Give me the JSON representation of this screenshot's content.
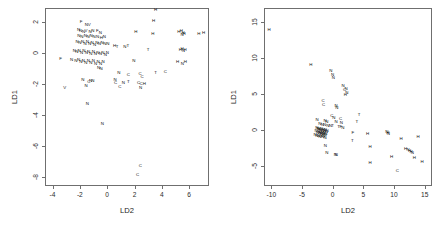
{
  "figure": {
    "type": "scatter-matrix",
    "panel_count": 2,
    "background": "#ffffff",
    "frame_color": "#6f6f6f",
    "text_color": "#111111"
  },
  "chart_data": [
    {
      "type": "scatter",
      "title": "",
      "subtitle": "",
      "xlabel": "LD2",
      "ylabel": "LD1",
      "xlim": [
        -4.55,
        7.45
      ],
      "ylim": [
        -8.6,
        2.9
      ],
      "xticks": [
        -4,
        -2,
        0,
        2,
        4,
        6
      ],
      "yticks": [
        2,
        0,
        -2,
        -4,
        -6,
        -8
      ],
      "xticklabels": [
        "-4",
        "-2",
        "0",
        "2",
        "4",
        "6"
      ],
      "yticklabels": [
        "2",
        "0",
        "-2",
        "-4",
        "-6",
        "-8"
      ],
      "grid": false,
      "legend": null,
      "marker_style": "text-glyph",
      "classes": [
        "H",
        "N",
        "C",
        "T",
        "V",
        "F"
      ],
      "points": [
        {
          "x": 3.55,
          "y": 2.78,
          "label": "H"
        },
        {
          "x": 3.4,
          "y": 2.05,
          "label": "H"
        },
        {
          "x": -1.9,
          "y": 2.02,
          "label": "F"
        },
        {
          "x": -1.52,
          "y": 1.8,
          "label": "N"
        },
        {
          "x": -1.32,
          "y": 1.78,
          "label": "V"
        },
        {
          "x": -2.1,
          "y": 1.48,
          "label": "N"
        },
        {
          "x": -1.95,
          "y": 1.4,
          "label": "N"
        },
        {
          "x": -1.72,
          "y": 1.38,
          "label": "N"
        },
        {
          "x": -1.55,
          "y": 1.42,
          "label": "V"
        },
        {
          "x": -1.25,
          "y": 1.36,
          "label": "N"
        },
        {
          "x": -1.05,
          "y": 1.42,
          "label": "N"
        },
        {
          "x": -0.72,
          "y": 1.4,
          "label": "F"
        },
        {
          "x": -0.5,
          "y": 1.28,
          "label": "N"
        },
        {
          "x": -2.08,
          "y": 1.1,
          "label": "N"
        },
        {
          "x": -1.86,
          "y": 1.05,
          "label": "N"
        },
        {
          "x": -1.6,
          "y": 1.12,
          "label": "N"
        },
        {
          "x": -1.4,
          "y": 1.0,
          "label": "N"
        },
        {
          "x": -1.18,
          "y": 1.08,
          "label": "N"
        },
        {
          "x": -0.95,
          "y": 1.0,
          "label": "N"
        },
        {
          "x": -0.7,
          "y": 1.05,
          "label": "N"
        },
        {
          "x": -0.42,
          "y": 0.98,
          "label": "H"
        },
        {
          "x": -0.2,
          "y": 1.05,
          "label": "N"
        },
        {
          "x": 2.1,
          "y": 1.32,
          "label": "H"
        },
        {
          "x": 3.35,
          "y": 1.25,
          "label": "H"
        },
        {
          "x": 5.25,
          "y": 1.35,
          "label": "H"
        },
        {
          "x": 5.42,
          "y": 1.4,
          "label": "H"
        },
        {
          "x": 5.55,
          "y": 1.3,
          "label": "H"
        },
        {
          "x": 5.62,
          "y": 1.22,
          "label": "H"
        },
        {
          "x": 5.48,
          "y": 1.18,
          "label": "N"
        },
        {
          "x": 6.7,
          "y": 1.2,
          "label": "H"
        },
        {
          "x": 7.05,
          "y": 1.28,
          "label": "H"
        },
        {
          "x": -2.2,
          "y": 0.7,
          "label": "N"
        },
        {
          "x": -2.0,
          "y": 0.62,
          "label": "N"
        },
        {
          "x": -1.8,
          "y": 0.72,
          "label": "N"
        },
        {
          "x": -1.62,
          "y": 0.58,
          "label": "N"
        },
        {
          "x": -1.45,
          "y": 0.68,
          "label": "N"
        },
        {
          "x": -1.28,
          "y": 0.55,
          "label": "N"
        },
        {
          "x": -1.1,
          "y": 0.66,
          "label": "N"
        },
        {
          "x": -0.92,
          "y": 0.52,
          "label": "N"
        },
        {
          "x": -0.75,
          "y": 0.62,
          "label": "N"
        },
        {
          "x": -0.58,
          "y": 0.58,
          "label": "N"
        },
        {
          "x": -0.38,
          "y": 0.64,
          "label": "N"
        },
        {
          "x": -0.18,
          "y": 0.55,
          "label": "N"
        },
        {
          "x": 0.05,
          "y": 0.6,
          "label": "N"
        },
        {
          "x": 0.55,
          "y": 0.42,
          "label": "H"
        },
        {
          "x": 0.72,
          "y": 0.38,
          "label": "T"
        },
        {
          "x": 1.3,
          "y": 0.35,
          "label": "N"
        },
        {
          "x": 1.52,
          "y": 0.45,
          "label": "T"
        },
        {
          "x": 3.0,
          "y": 0.18,
          "label": "T"
        },
        {
          "x": 5.35,
          "y": 0.18,
          "label": "H"
        },
        {
          "x": 5.48,
          "y": 0.22,
          "label": "H"
        },
        {
          "x": 5.58,
          "y": 0.12,
          "label": "N"
        },
        {
          "x": 5.7,
          "y": 0.2,
          "label": "H"
        },
        {
          "x": -2.4,
          "y": 0.1,
          "label": "N"
        },
        {
          "x": -2.22,
          "y": 0.05,
          "label": "N"
        },
        {
          "x": -2.05,
          "y": 0.12,
          "label": "N"
        },
        {
          "x": -1.88,
          "y": 0.0,
          "label": "N"
        },
        {
          "x": -1.7,
          "y": 0.1,
          "label": "N"
        },
        {
          "x": -1.52,
          "y": -0.02,
          "label": "N"
        },
        {
          "x": -1.36,
          "y": 0.08,
          "label": "N"
        },
        {
          "x": -1.2,
          "y": -0.05,
          "label": "N"
        },
        {
          "x": -1.02,
          "y": 0.05,
          "label": "N"
        },
        {
          "x": -0.86,
          "y": -0.08,
          "label": "N"
        },
        {
          "x": -0.68,
          "y": 0.02,
          "label": "N"
        },
        {
          "x": -0.5,
          "y": -0.1,
          "label": "N"
        },
        {
          "x": -0.32,
          "y": 0.0,
          "label": "N"
        },
        {
          "x": -0.14,
          "y": -0.12,
          "label": "N"
        },
        {
          "x": 0.02,
          "y": -0.02,
          "label": "N"
        },
        {
          "x": -3.4,
          "y": -0.42,
          "label": "F"
        },
        {
          "x": -2.6,
          "y": -0.48,
          "label": "N"
        },
        {
          "x": -2.3,
          "y": -0.55,
          "label": "N"
        },
        {
          "x": -2.1,
          "y": -0.45,
          "label": "N"
        },
        {
          "x": -1.92,
          "y": -0.6,
          "label": "N"
        },
        {
          "x": -1.74,
          "y": -0.5,
          "label": "N"
        },
        {
          "x": -1.56,
          "y": -0.65,
          "label": "N"
        },
        {
          "x": -1.38,
          "y": -0.52,
          "label": "N"
        },
        {
          "x": -1.2,
          "y": -0.68,
          "label": "N"
        },
        {
          "x": -1.02,
          "y": -0.55,
          "label": "N"
        },
        {
          "x": -0.84,
          "y": -0.7,
          "label": "N"
        },
        {
          "x": -0.66,
          "y": -0.58,
          "label": "N"
        },
        {
          "x": -0.48,
          "y": -0.72,
          "label": "N"
        },
        {
          "x": -0.3,
          "y": -0.6,
          "label": "N"
        },
        {
          "x": -0.62,
          "y": -0.95,
          "label": "N"
        },
        {
          "x": -0.45,
          "y": -1.02,
          "label": "N"
        },
        {
          "x": 1.95,
          "y": -0.55,
          "label": "N"
        },
        {
          "x": 5.15,
          "y": -0.62,
          "label": "H"
        },
        {
          "x": 5.5,
          "y": -0.7,
          "label": "N"
        },
        {
          "x": 5.72,
          "y": -0.62,
          "label": "H"
        },
        {
          "x": 3.55,
          "y": -1.28,
          "label": "T"
        },
        {
          "x": 4.25,
          "y": -1.25,
          "label": "C"
        },
        {
          "x": 0.85,
          "y": -1.28,
          "label": "N"
        },
        {
          "x": 1.55,
          "y": -1.4,
          "label": "C"
        },
        {
          "x": 2.4,
          "y": -1.38,
          "label": "C"
        },
        {
          "x": 2.55,
          "y": -1.55,
          "label": "C"
        },
        {
          "x": -1.78,
          "y": -1.78,
          "label": "N"
        },
        {
          "x": -1.35,
          "y": -1.85,
          "label": "C"
        },
        {
          "x": -1.22,
          "y": -1.8,
          "label": "N"
        },
        {
          "x": -1.05,
          "y": -1.82,
          "label": "N"
        },
        {
          "x": 0.58,
          "y": -1.72,
          "label": "N"
        },
        {
          "x": 0.62,
          "y": -1.95,
          "label": "C"
        },
        {
          "x": 1.18,
          "y": -1.92,
          "label": "N"
        },
        {
          "x": 1.55,
          "y": -1.9,
          "label": "T"
        },
        {
          "x": 2.3,
          "y": -1.92,
          "label": "C"
        },
        {
          "x": 2.48,
          "y": -2.0,
          "label": "C"
        },
        {
          "x": 2.72,
          "y": -1.98,
          "label": "H"
        },
        {
          "x": -3.1,
          "y": -2.3,
          "label": "V"
        },
        {
          "x": -1.55,
          "y": -2.15,
          "label": "N"
        },
        {
          "x": 0.92,
          "y": -2.22,
          "label": "C"
        },
        {
          "x": 2.45,
          "y": -2.3,
          "label": "N"
        },
        {
          "x": -1.45,
          "y": -3.3,
          "label": "N"
        },
        {
          "x": -0.35,
          "y": -4.58,
          "label": "N"
        },
        {
          "x": 2.42,
          "y": -7.3,
          "label": "C"
        },
        {
          "x": 2.22,
          "y": -7.88,
          "label": "C"
        }
      ]
    },
    {
      "type": "scatter",
      "title": "",
      "subtitle": "",
      "xlabel": "LD2",
      "ylabel": "LD1",
      "xlim": [
        -11.2,
        16.2
      ],
      "ylim": [
        -7.8,
        17.0
      ],
      "xticks": [
        -10,
        -5,
        0,
        5,
        10,
        15
      ],
      "yticks": [
        15,
        10,
        5,
        0,
        -5
      ],
      "xticklabels": [
        "-10",
        "-5",
        "0",
        "5",
        "10",
        "15"
      ],
      "yticklabels": [
        "15",
        "10",
        "5",
        "0",
        "-5"
      ],
      "grid": false,
      "legend": null,
      "marker_style": "text-glyph",
      "classes": [
        "H",
        "N",
        "C",
        "T",
        "F"
      ],
      "points": [
        {
          "x": -10.35,
          "y": 13.9,
          "label": "H"
        },
        {
          "x": -3.55,
          "y": 9.0,
          "label": "H"
        },
        {
          "x": -0.3,
          "y": 8.2,
          "label": "N"
        },
        {
          "x": 0.0,
          "y": 7.6,
          "label": "N"
        },
        {
          "x": 0.1,
          "y": 7.3,
          "label": "N"
        },
        {
          "x": 1.7,
          "y": 6.1,
          "label": "N"
        },
        {
          "x": 1.95,
          "y": 5.6,
          "label": "C"
        },
        {
          "x": 2.2,
          "y": 5.7,
          "label": "N"
        },
        {
          "x": 2.3,
          "y": 5.2,
          "label": "N"
        },
        {
          "x": 2.05,
          "y": 4.9,
          "label": "H"
        },
        {
          "x": -1.55,
          "y": 4.1,
          "label": "C"
        },
        {
          "x": -1.5,
          "y": 3.5,
          "label": "C"
        },
        {
          "x": 0.55,
          "y": 3.4,
          "label": "N"
        },
        {
          "x": 0.7,
          "y": 3.0,
          "label": "N"
        },
        {
          "x": 4.3,
          "y": 2.1,
          "label": "T"
        },
        {
          "x": -0.15,
          "y": 1.95,
          "label": "C"
        },
        {
          "x": 0.2,
          "y": 1.7,
          "label": "N"
        },
        {
          "x": 1.3,
          "y": 1.6,
          "label": "C"
        },
        {
          "x": -2.55,
          "y": 1.4,
          "label": "N"
        },
        {
          "x": -1.25,
          "y": 1.25,
          "label": "N"
        },
        {
          "x": -0.95,
          "y": 1.15,
          "label": "N"
        },
        {
          "x": 0.55,
          "y": 1.05,
          "label": "N"
        },
        {
          "x": 1.4,
          "y": 1.0,
          "label": "N"
        },
        {
          "x": 3.95,
          "y": 1.1,
          "label": "T"
        },
        {
          "x": -2.1,
          "y": 0.8,
          "label": "N"
        },
        {
          "x": -1.7,
          "y": 0.75,
          "label": "N"
        },
        {
          "x": -1.3,
          "y": 0.7,
          "label": "N"
        },
        {
          "x": -0.8,
          "y": 0.62,
          "label": "N"
        },
        {
          "x": -0.4,
          "y": 0.58,
          "label": "N"
        },
        {
          "x": 0.0,
          "y": 0.5,
          "label": "T"
        },
        {
          "x": 0.95,
          "y": 0.42,
          "label": "T"
        },
        {
          "x": 1.35,
          "y": 0.45,
          "label": "F"
        },
        {
          "x": 1.65,
          "y": 0.3,
          "label": "N"
        },
        {
          "x": -2.6,
          "y": 0.3,
          "label": "N"
        },
        {
          "x": -2.4,
          "y": 0.2,
          "label": "N"
        },
        {
          "x": -2.25,
          "y": 0.12,
          "label": "N"
        },
        {
          "x": -2.1,
          "y": 0.05,
          "label": "N"
        },
        {
          "x": -1.95,
          "y": -0.02,
          "label": "N"
        },
        {
          "x": -1.8,
          "y": 0.1,
          "label": "N"
        },
        {
          "x": -1.65,
          "y": -0.08,
          "label": "N"
        },
        {
          "x": -1.5,
          "y": 0.02,
          "label": "N"
        },
        {
          "x": -1.35,
          "y": -0.15,
          "label": "N"
        },
        {
          "x": -1.2,
          "y": -0.05,
          "label": "N"
        },
        {
          "x": -1.05,
          "y": -0.22,
          "label": "N"
        },
        {
          "x": -0.9,
          "y": -0.1,
          "label": "N"
        },
        {
          "x": -2.7,
          "y": -0.2,
          "label": "N"
        },
        {
          "x": -2.5,
          "y": -0.35,
          "label": "N"
        },
        {
          "x": -2.3,
          "y": -0.28,
          "label": "N"
        },
        {
          "x": -2.15,
          "y": -0.45,
          "label": "N"
        },
        {
          "x": -2.0,
          "y": -0.38,
          "label": "N"
        },
        {
          "x": -1.85,
          "y": -0.52,
          "label": "N"
        },
        {
          "x": -1.7,
          "y": -0.42,
          "label": "N"
        },
        {
          "x": -1.55,
          "y": -0.6,
          "label": "N"
        },
        {
          "x": -1.4,
          "y": -0.48,
          "label": "N"
        },
        {
          "x": -1.25,
          "y": -0.65,
          "label": "N"
        },
        {
          "x": -1.1,
          "y": -0.55,
          "label": "N"
        },
        {
          "x": -2.85,
          "y": -0.7,
          "label": "N"
        },
        {
          "x": -2.6,
          "y": -0.85,
          "label": "N"
        },
        {
          "x": -2.35,
          "y": -0.78,
          "label": "N"
        },
        {
          "x": -2.1,
          "y": -0.92,
          "label": "N"
        },
        {
          "x": -1.9,
          "y": -0.85,
          "label": "N"
        },
        {
          "x": -1.65,
          "y": -1.0,
          "label": "N"
        },
        {
          "x": -1.45,
          "y": -0.9,
          "label": "N"
        },
        {
          "x": -1.25,
          "y": -1.1,
          "label": "N"
        },
        {
          "x": 3.3,
          "y": -0.45,
          "label": "F"
        },
        {
          "x": 5.7,
          "y": -0.5,
          "label": "H"
        },
        {
          "x": 8.85,
          "y": -0.3,
          "label": "N"
        },
        {
          "x": 9.0,
          "y": -0.45,
          "label": "H"
        },
        {
          "x": 9.1,
          "y": -0.55,
          "label": "N"
        },
        {
          "x": 11.15,
          "y": -1.25,
          "label": "H"
        },
        {
          "x": 13.95,
          "y": -0.95,
          "label": "H"
        },
        {
          "x": -1.2,
          "y": -2.2,
          "label": "N"
        },
        {
          "x": 3.2,
          "y": -1.55,
          "label": "T"
        },
        {
          "x": 6.1,
          "y": -2.4,
          "label": "H"
        },
        {
          "x": 11.9,
          "y": -2.6,
          "label": "H"
        },
        {
          "x": 12.3,
          "y": -2.8,
          "label": "N"
        },
        {
          "x": 12.55,
          "y": -2.95,
          "label": "H"
        },
        {
          "x": 12.8,
          "y": -3.05,
          "label": "H"
        },
        {
          "x": 13.0,
          "y": -3.2,
          "label": "N"
        },
        {
          "x": -0.95,
          "y": -3.2,
          "label": "N"
        },
        {
          "x": 0.45,
          "y": -3.45,
          "label": "N"
        },
        {
          "x": 0.6,
          "y": -3.5,
          "label": "N"
        },
        {
          "x": 9.6,
          "y": -3.8,
          "label": "H"
        },
        {
          "x": 13.3,
          "y": -3.95,
          "label": "H"
        },
        {
          "x": 6.1,
          "y": -4.55,
          "label": "H"
        },
        {
          "x": 14.6,
          "y": -4.4,
          "label": "H"
        },
        {
          "x": 10.55,
          "y": -5.7,
          "label": "C"
        }
      ]
    }
  ]
}
